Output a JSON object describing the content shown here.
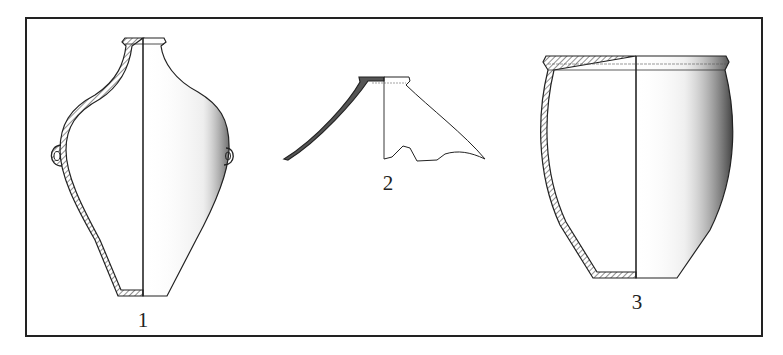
{
  "figure": {
    "frame": {
      "border_color": "#222222",
      "background": "#ffffff"
    },
    "vessels": [
      {
        "id": "vessel-1",
        "label": "1",
        "type": "double-handled jar (section + exterior)"
      },
      {
        "id": "vessel-2",
        "label": "2",
        "type": "jar shoulder fragment (section + exterior)"
      },
      {
        "id": "vessel-3",
        "label": "3",
        "type": "deep-bellied pot (section + exterior)"
      }
    ],
    "colors": {
      "line": "#222222",
      "shading": "#555555",
      "hatch": "#444444"
    }
  }
}
